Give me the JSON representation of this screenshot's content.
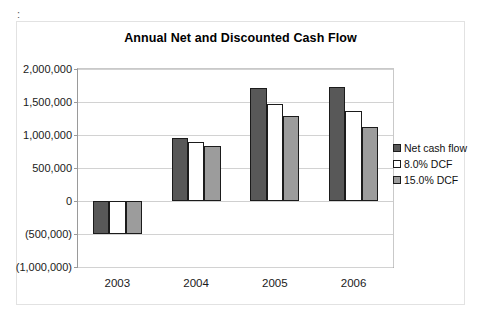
{
  "artifacts": {
    "top_text": "",
    "colon_mark": ":"
  },
  "chart_data": {
    "type": "bar",
    "title": "Annual Net and Discounted Cash Flow",
    "xlabel": "",
    "ylabel": "",
    "categories": [
      "2003",
      "2004",
      "2005",
      "2006"
    ],
    "series": [
      {
        "name": "Net cash flow",
        "color": "#585858",
        "values": [
          -500000,
          950000,
          1710000,
          1720000
        ]
      },
      {
        "name": "8.0% DCF",
        "color": "#ffffff",
        "values": [
          -500000,
          890000,
          1465000,
          1360000
        ]
      },
      {
        "name": "15.0% DCF",
        "color": "#9c9c9c",
        "values": [
          -500000,
          830000,
          1285000,
          1120000
        ]
      }
    ],
    "ylim": [
      -1000000,
      2000000
    ],
    "ytick_values": [
      2000000,
      1500000,
      1000000,
      500000,
      0,
      -500000,
      -1000000
    ],
    "ytick_labels": [
      "2,000,000",
      "1,500,000",
      "1,000,000",
      "500,000",
      "0",
      "(500,000)",
      "(1,000,000)"
    ],
    "grid": true,
    "legend_position": "right"
  }
}
